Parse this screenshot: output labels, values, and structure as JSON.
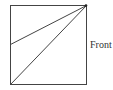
{
  "diagram": {
    "type": "geometric-line-diagram",
    "square": {
      "x": 10,
      "y": 5,
      "width": 76,
      "height": 79
    },
    "lines": [
      {
        "name": "diagonal-to-bottom-left",
        "from": [
          86,
          5
        ],
        "to": [
          10,
          84
        ]
      },
      {
        "name": "line-to-left-mid",
        "from": [
          86,
          5
        ],
        "to": [
          10,
          44
        ]
      }
    ],
    "vertex_dot": {
      "x": 86,
      "y": 5
    },
    "labels": {
      "front": "Front"
    },
    "colors": {
      "stroke": "#444444",
      "text": "#333333",
      "background": "#ffffff"
    }
  }
}
